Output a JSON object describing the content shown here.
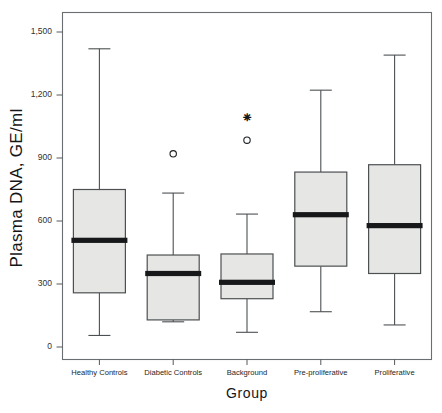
{
  "chart_data": {
    "type": "box",
    "title": "",
    "xlabel": "Group",
    "ylabel": "Plasma DNA, GE/ml",
    "ylim": [
      0,
      1560
    ],
    "yticks": [
      0,
      300,
      600,
      900,
      1200,
      1500
    ],
    "ytick_labels": [
      "0",
      "300",
      "600",
      "900",
      "1,200",
      "1,500"
    ],
    "grid": false,
    "legend": null,
    "categories": [
      "Healthy Controls",
      "Diabetic Controls",
      "Background",
      "Pre-proliferative",
      "Proliferative"
    ],
    "boxes": [
      {
        "category": "Healthy Controls",
        "whisker_low": 55,
        "q1": 258,
        "median": 508,
        "q3": 750,
        "whisker_high": 1420,
        "outliers": [],
        "extremes": []
      },
      {
        "category": "Diabetic Controls",
        "whisker_low": 120,
        "q1": 129,
        "median": 350,
        "q3": 438,
        "whisker_high": 733,
        "outliers": [
          920
        ],
        "extremes": []
      },
      {
        "category": "Background",
        "whisker_low": 70,
        "q1": 230,
        "median": 308,
        "q3": 443,
        "whisker_high": 633,
        "outliers": [
          985
        ],
        "extremes": [
          1088
        ]
      },
      {
        "category": "Pre-proliferative",
        "whisker_low": 168,
        "q1": 385,
        "median": 630,
        "q3": 833,
        "whisker_high": 1223,
        "outliers": [],
        "extremes": []
      },
      {
        "category": "Proliferative",
        "whisker_low": 105,
        "q1": 350,
        "median": 578,
        "q3": 868,
        "whisker_high": 1390,
        "outliers": [],
        "extremes": []
      }
    ],
    "colors": {
      "box_fill": "#e6e6e4",
      "box_stroke": "#4c5052",
      "median": "#16181a",
      "outlier": "#1c1f21",
      "frame": "#6a6e71",
      "text": "#141618",
      "background": "#ffffff"
    }
  }
}
